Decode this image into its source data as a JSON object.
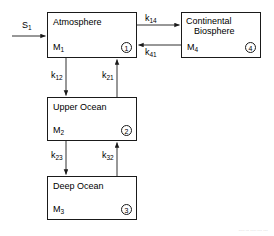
{
  "diagram": {
    "type": "compartment-flow-diagram",
    "background_color": "#ffffff",
    "stroke_color": "#1a1a1a",
    "boxes": [
      {
        "id": "atmosphere",
        "title": "Atmosphere",
        "title_line2": "",
        "mass": "M",
        "mass_subscript": "1",
        "index": "1",
        "x": 47,
        "y": 12,
        "width": 90,
        "height": 46
      },
      {
        "id": "continental-biosphere",
        "title": "Continental",
        "title_line2": "Biosphere",
        "mass": "M",
        "mass_subscript": "4",
        "index": "4",
        "x": 181,
        "y": 12,
        "width": 80,
        "height": 46
      },
      {
        "id": "upper-ocean",
        "title": "Upper Ocean",
        "title_line2": "",
        "mass": "M",
        "mass_subscript": "2",
        "index": "2",
        "x": 47,
        "y": 97,
        "width": 90,
        "height": 44
      },
      {
        "id": "deep-ocean",
        "title": "Deep Ocean",
        "title_line2": "",
        "mass": "M",
        "mass_subscript": "3",
        "index": "3",
        "x": 47,
        "y": 176,
        "width": 90,
        "height": 44
      }
    ],
    "source_flux": {
      "id": "s1",
      "label": "S",
      "subscript": "1",
      "target": "atmosphere",
      "direction": "right"
    },
    "flows": [
      {
        "id": "k14",
        "label": "k",
        "subscript": "14",
        "from": "atmosphere",
        "to": "continental-biosphere",
        "direction": "right"
      },
      {
        "id": "k41",
        "label": "k",
        "subscript": "41",
        "from": "continental-biosphere",
        "to": "atmosphere",
        "direction": "left"
      },
      {
        "id": "k12",
        "label": "k",
        "subscript": "12",
        "from": "atmosphere",
        "to": "upper-ocean",
        "direction": "down"
      },
      {
        "id": "k21",
        "label": "k",
        "subscript": "21",
        "from": "upper-ocean",
        "to": "atmosphere",
        "direction": "up"
      },
      {
        "id": "k23",
        "label": "k",
        "subscript": "23",
        "from": "upper-ocean",
        "to": "deep-ocean",
        "direction": "down"
      },
      {
        "id": "k32",
        "label": "k",
        "subscript": "32",
        "from": "deep-ocean",
        "to": "upper-ocean",
        "direction": "up"
      }
    ],
    "footer_note": "····· ··· ····· ···· ····"
  }
}
